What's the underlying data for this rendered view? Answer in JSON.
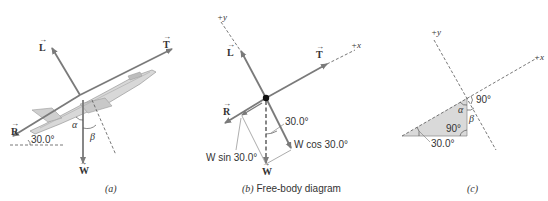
{
  "figure": {
    "panels": [
      {
        "id": "a",
        "caption": "(a)",
        "vectors": {
          "lift": "L",
          "thrust": "T",
          "drag": "R",
          "weight": "W"
        },
        "angles": {
          "climb": "30.0°",
          "alpha": "α",
          "beta": "β"
        }
      },
      {
        "id": "b",
        "caption_letter": "(b)",
        "caption_text": "Free-body diagram",
        "axes": {
          "y": "+y",
          "x": "+x"
        },
        "vectors": {
          "lift": "L",
          "thrust": "T",
          "drag": "R",
          "weight": "W"
        },
        "components": {
          "w_sin": "W sin 30.0°",
          "w_cos": "W cos 30.0°"
        },
        "angle": "30.0°"
      },
      {
        "id": "c",
        "caption": "(c)",
        "axes": {
          "y": "+y",
          "x": "+x"
        },
        "angles": {
          "right_top": "90°",
          "right_triangle": "90°",
          "alpha": "α",
          "beta": "β",
          "base": "30.0°"
        }
      }
    ],
    "colors": {
      "vector": "#7a7a7a",
      "dashed": "#555555",
      "triangle_fill": "#d9d9d9",
      "dot": "#111111"
    }
  }
}
